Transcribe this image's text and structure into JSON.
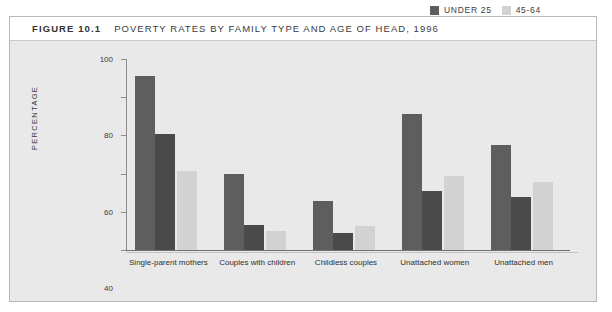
{
  "figure": {
    "number": "FIGURE 10.1",
    "title": "POVERTY RATES BY FAMILY TYPE AND AGE OF HEAD, 1996"
  },
  "colors": {
    "series_under25": "#5e5e5e",
    "series_25_44": "#4a4a4a",
    "series_45_64": "#d2d2d2",
    "panel_background": "#e9e9e9",
    "title_background": "#ffffff",
    "axis": "#8d8d8d",
    "text": "#3a3a3a"
  },
  "legend": {
    "position": "top-right",
    "entries": [
      {
        "label": "UNDER 25",
        "color": "#5e5e5e"
      },
      {
        "label": "45-64",
        "color": "#d2d2d2"
      },
      {
        "label": "25-44",
        "color": "#4a4a4a"
      }
    ]
  },
  "chart_data": {
    "type": "bar",
    "title": "POVERTY RATES BY FAMILY TYPE AND AGE OF HEAD, 1996",
    "xlabel": "",
    "ylabel": "PERCENTAGE",
    "ylim": [
      0,
      100
    ],
    "yticks": [
      0,
      20,
      40,
      60,
      80,
      100
    ],
    "grid": false,
    "legend_position": "top-right",
    "categories": [
      "Single-parent mothers",
      "Couples with children",
      "Childless couples",
      "Unattached women",
      "Unattached men"
    ],
    "series": [
      {
        "name": "UNDER 25",
        "color": "#5e5e5e",
        "values": [
          91,
          40,
          25.5,
          71,
          55
        ]
      },
      {
        "name": "25-44",
        "color": "#4a4a4a",
        "values": [
          60.5,
          13,
          9,
          31,
          27.5
        ]
      },
      {
        "name": "45-64",
        "color": "#d2d2d2",
        "values": [
          41.5,
          10,
          12.5,
          39,
          35.5
        ]
      }
    ]
  }
}
